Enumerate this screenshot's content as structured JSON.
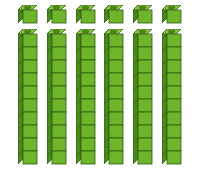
{
  "diagram": {
    "units": {
      "count": 6,
      "label": "ones"
    },
    "rods": {
      "count": 6,
      "cubes_per_rod": 10,
      "label": "tens"
    },
    "total_value": 66,
    "colors": {
      "front": "#6fb52c",
      "side": "#4a8a1c",
      "top": "#8cc63f",
      "outline": "#2f5a10"
    }
  }
}
